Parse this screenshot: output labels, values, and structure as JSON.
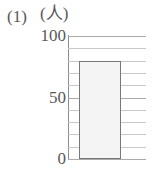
{
  "figure": {
    "number_label": "(1)",
    "unit_label": "(人)"
  },
  "chart_data": {
    "type": "bar",
    "title": "",
    "xlabel": "",
    "ylabel": "(人)",
    "ylim": [
      0,
      100
    ],
    "ytick_labels": [
      "100",
      "50",
      "0"
    ],
    "ytick_values": [
      100,
      50,
      0
    ],
    "gridline_step": 10,
    "gridline_values": [
      0,
      10,
      20,
      30,
      40,
      50,
      60,
      70,
      80,
      90,
      100
    ],
    "grid": true,
    "legend": false,
    "categories": [
      ""
    ],
    "values": [
      80
    ],
    "bar_fill_color": "#f4f4f4",
    "bar_border_color": "#787878",
    "gridline_color": "#c8c8c8",
    "axis_color": "#8d8d8d",
    "text_color": "#585858"
  }
}
